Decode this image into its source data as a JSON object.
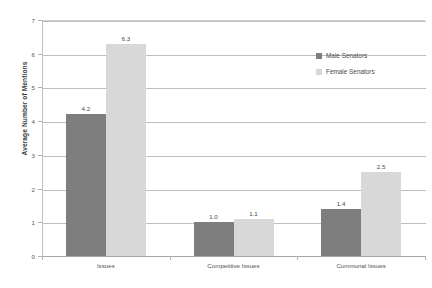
{
  "chart_data": {
    "type": "bar",
    "title": "",
    "xlabel": "",
    "ylabel": "Average Number of Mentions",
    "ylim": [
      0,
      7
    ],
    "ytick_labels": [
      "0",
      "1",
      "2",
      "3",
      "4",
      "5",
      "6",
      "7"
    ],
    "grid": true,
    "legend_position": "upper-right",
    "categories": [
      "Issues",
      "Competitive Issues",
      "Communal Issues"
    ],
    "series": [
      {
        "name": "Male Senators",
        "color": "#7e7e7e",
        "values": [
          4.2,
          1.0,
          1.4
        ],
        "labels": [
          "4.2",
          "1.0",
          "1.4"
        ]
      },
      {
        "name": "Female Senators",
        "color": "#d8d8d8",
        "values": [
          6.3,
          1.1,
          2.5
        ],
        "labels": [
          "6.3",
          "1.1",
          "2.5"
        ]
      }
    ]
  },
  "legend": {
    "items": [
      {
        "label": "Male Senators",
        "swatch": "male"
      },
      {
        "label": "Female Senators",
        "swatch": "female"
      }
    ]
  }
}
